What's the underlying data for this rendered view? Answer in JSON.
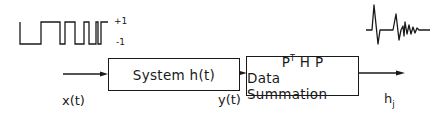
{
  "input_signal": {
    "type": "pseudo-random binary sequence",
    "level_high_label": "+1",
    "level_low_label": "-1"
  },
  "labels": {
    "input": "x(t)",
    "intermediate": "y(t)",
    "output_base": "h",
    "output_sub": "j"
  },
  "blocks": [
    {
      "id": "system",
      "text": "System h(t)"
    },
    {
      "id": "processing",
      "line1_base": "P",
      "line1_sup": "T",
      "line1_rest": " H P",
      "line2": "Data Summation"
    }
  ],
  "output_signal": {
    "type": "impulse response waveform"
  },
  "colors": {
    "stroke": "#1a1a1a",
    "background": "#ffffff"
  }
}
